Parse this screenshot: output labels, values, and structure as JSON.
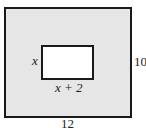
{
  "diagram": {
    "outer_width_label": "12",
    "outer_height_label": "10",
    "inner_height_label": "x",
    "inner_width_label": "x + 2",
    "fill_color": "#e6e6e6",
    "stroke_color": "#1a1a1a"
  }
}
